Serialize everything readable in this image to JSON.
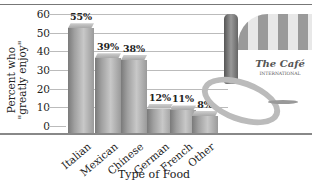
{
  "chart_data": {
    "type": "bar",
    "title": "",
    "xlabel": "Type of Food",
    "ylabel": "Percent who \"greatly enjoy\"",
    "categories": [
      "Italian",
      "Mexican",
      "Chinese",
      "German",
      "French",
      "Other"
    ],
    "values": [
      55,
      39,
      38,
      12,
      11,
      8
    ],
    "value_labels": [
      "55%",
      "39%",
      "38%",
      "12%",
      "11%",
      "8%"
    ],
    "yticks": [
      0,
      10,
      20,
      30,
      40,
      50,
      60
    ],
    "ylim": [
      0,
      60
    ],
    "grid": true,
    "legend": null,
    "annotations": [
      "The Café",
      "INTERNATIONAL"
    ]
  },
  "colors": {
    "bar": "#a0a0a0",
    "grid": "#bbbbbb",
    "axis": "#888888"
  },
  "labels": {
    "ylabel_line1": "Percent who",
    "ylabel_line2": "\"greatly enjoy\"",
    "xlabel": "Type of Food",
    "cafe_name": "The Café",
    "cafe_sub": "INTERNATIONAL"
  }
}
